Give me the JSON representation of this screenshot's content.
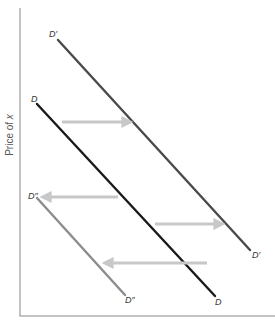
{
  "diagram": {
    "title": "",
    "y_axis_label_prefix": "Price of ",
    "y_axis_label_var": "x",
    "x_axis_label": "",
    "colors": {
      "axis": "#8a8a8a",
      "D": "#1a1a1a",
      "D_prime": "#4a4a4a",
      "D_double_prime": "#8c8c8c",
      "arrow": "#c8c8c8"
    },
    "curves": [
      {
        "id": "D_prime",
        "label_top": "D′",
        "label_bottom": "D′",
        "x1": 58,
        "y1": 40,
        "x2": 250,
        "y2": 250
      },
      {
        "id": "D",
        "label_top": "D",
        "label_bottom": "D",
        "x1": 37,
        "y1": 104,
        "x2": 215,
        "y2": 296
      },
      {
        "id": "D_double_prime",
        "label_top": "D″",
        "label_bottom": "D″",
        "x1": 37,
        "y1": 198,
        "x2": 125,
        "y2": 295
      }
    ],
    "arrows": [
      {
        "direction": "right",
        "x1": 62,
        "x2": 133,
        "y": 122,
        "meaning": "shift from D to D′"
      },
      {
        "direction": "left",
        "x1": 118,
        "x2": 40,
        "y": 197,
        "meaning": "shift from D to D″"
      },
      {
        "direction": "right",
        "x1": 155,
        "x2": 225,
        "y": 224,
        "meaning": "shift from D to D′"
      },
      {
        "direction": "left",
        "x1": 207,
        "x2": 102,
        "y": 263,
        "meaning": "shift from D to D″"
      }
    ]
  }
}
